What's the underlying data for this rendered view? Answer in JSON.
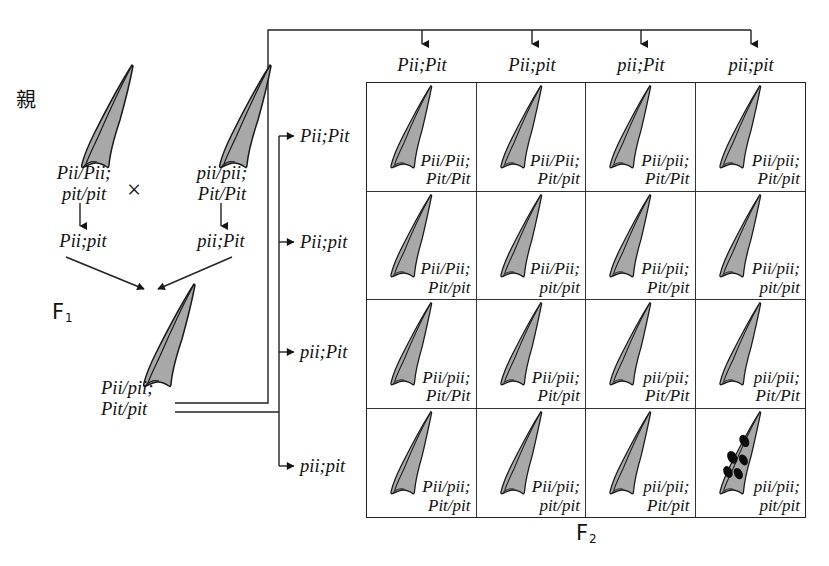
{
  "figure": {
    "type": "genetic-cross-punnett-square",
    "parent_label": "親",
    "f1_label": "F",
    "f1_sub": "1",
    "f2_label": "F",
    "f2_sub": "2",
    "cross_symbol": "×"
  },
  "parents": {
    "left": {
      "genotype_line1": "Pii/Pii;",
      "genotype_line2": "pit/pit",
      "gamete": "Pii;pit"
    },
    "right": {
      "genotype_line1": "pii/pii;",
      "genotype_line2": "Pit/Pit",
      "gamete": "pii;Pit"
    }
  },
  "f1": {
    "genotype_line1": "Pii/pii;",
    "genotype_line2": "Pit/pit"
  },
  "grid": {
    "column_headers": [
      "Pii;Pit",
      "Pii;pit",
      "pii;Pit",
      "pii;pit"
    ],
    "row_headers": [
      "Pii;Pit",
      "Pii;pit",
      "pii;Pit",
      "pii;pit"
    ],
    "cells": [
      [
        {
          "line1": "Pii/Pii;",
          "line2": "Pit/Pit",
          "phenotype": "resistant"
        },
        {
          "line1": "Pii/Pii;",
          "line2": "Pit/pit",
          "phenotype": "resistant"
        },
        {
          "line1": "Pii/pii;",
          "line2": "Pit/Pit",
          "phenotype": "resistant"
        },
        {
          "line1": "Pii/pii;",
          "line2": "Pit/pit",
          "phenotype": "resistant"
        }
      ],
      [
        {
          "line1": "Pii/Pii;",
          "line2": "Pit/pit",
          "phenotype": "resistant"
        },
        {
          "line1": "Pii/Pii;",
          "line2": "pit/pit",
          "phenotype": "resistant"
        },
        {
          "line1": "Pii/pii;",
          "line2": "Pit/pit",
          "phenotype": "resistant"
        },
        {
          "line1": "Pii/pii;",
          "line2": "pit/pit",
          "phenotype": "resistant"
        }
      ],
      [
        {
          "line1": "Pii/pii;",
          "line2": "Pit/Pit",
          "phenotype": "resistant"
        },
        {
          "line1": "Pii/pii;",
          "line2": "Pit/pit",
          "phenotype": "resistant"
        },
        {
          "line1": "pii/pii;",
          "line2": "Pit/Pit",
          "phenotype": "resistant"
        },
        {
          "line1": "pii/pii;",
          "line2": "Pit/Pit",
          "phenotype": "resistant"
        }
      ],
      [
        {
          "line1": "Pii/pii;",
          "line2": "Pit/pit",
          "phenotype": "resistant"
        },
        {
          "line1": "Pii/pii;",
          "line2": "pit/pit",
          "phenotype": "resistant"
        },
        {
          "line1": "pii/pii;",
          "line2": "Pit/pit",
          "phenotype": "resistant"
        },
        {
          "line1": "pii/pii;",
          "line2": "pit/pit",
          "phenotype": "susceptible"
        }
      ]
    ]
  },
  "colors": {
    "leaf_fill": "#a8a8a8",
    "leaf_stroke": "#1a1a1a",
    "lesion_fill": "#0b0b0b",
    "line": "#222222",
    "background": "#ffffff"
  }
}
